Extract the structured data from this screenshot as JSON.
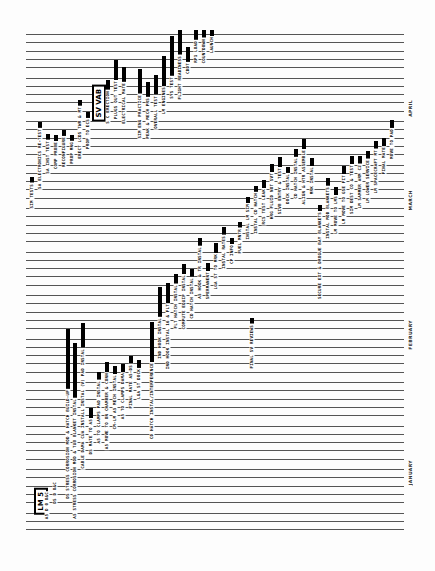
{
  "document": {
    "title": "LM-5 / SV VAB Processing Schedule (rotated Gantt chart)",
    "orientation": "rotated 90 degrees counterclockwise",
    "months": [
      {
        "label": "APRIL",
        "y": 100
      },
      {
        "label": "MARCH",
        "y": 190
      },
      {
        "label": "FEBRUARY",
        "y": 320
      },
      {
        "label": "JANUARY",
        "y": 460
      }
    ],
    "boxed_labels": [
      {
        "label": "LM 5",
        "x": 34,
        "y": 488
      },
      {
        "label": "SV VAB",
        "x": 92,
        "y": 85
      }
    ],
    "rules": {
      "count": 58,
      "top": 34,
      "spacing": 8.8
    },
    "tasks": [
      {
        "label": "A5 D 0 O&C",
        "x": 45,
        "bottom": 520,
        "bar": 0
      },
      {
        "label": "DS D O&C",
        "x": 53,
        "bottom": 505,
        "bar": 0
      },
      {
        "label": "DS STRESS CORROSION MOD & HATCH BUILD-UP",
        "x": 66,
        "bottom": 500,
        "bar": 60
      },
      {
        "label": "A5 STRESS CORROSION MOD & TUB BLANKET INSTAL",
        "x": 73,
        "bottom": 520,
        "bar": 55
      },
      {
        "label": "CABLE DAMA CUA INSTALL INSTAL (V) PAD INSTAL",
        "x": 81,
        "bottom": 470,
        "bar": 25
      },
      {
        "label": "DS MATE TO A5",
        "x": 89,
        "bottom": 455,
        "bar": 10
      },
      {
        "label": "A5 TO CLAMPS PAD INSTAL",
        "x": 97,
        "bottom": 445,
        "bar": 8
      },
      {
        "label": "A5 MOVE TO ON CHAMBER & CONN",
        "x": 105,
        "bottom": 450,
        "bar": 10
      },
      {
        "label": "CM-LM A5 MECH INSTAL",
        "x": 113,
        "bottom": 430,
        "bar": 8
      },
      {
        "label": "A5 TO CLAMPS DAMA",
        "x": 121,
        "bottom": 420,
        "bar": 8
      },
      {
        "label": "FINAL MATE A5-DS",
        "x": 129,
        "bottom": 410,
        "bar": 8
      },
      {
        "label": "LGA ST DOCK",
        "x": 137,
        "bottom": 400,
        "bar": 8
      },
      {
        "label": "CD HATCH INSTAL/INTERFERENCE",
        "x": 150,
        "bottom": 440,
        "bar": 40
      },
      {
        "label": "IND HOOK INSTAL",
        "x": 158,
        "bottom": 360,
        "bar": 30
      },
      {
        "label": "IND HOOK INSTAL 16 & FLT",
        "x": 166,
        "bottom": 370,
        "bar": 20
      },
      {
        "label": "FLT HATCH INSTAL",
        "x": 174,
        "bottom": 330,
        "bar": 10
      },
      {
        "label": "COMPUTE EQUIP INSTAL",
        "x": 182,
        "bottom": 330,
        "bar": 10
      },
      {
        "label": "CD HATCH INSTAL",
        "x": 190,
        "bottom": 320,
        "bar": 8
      },
      {
        "label": "A5 HOOK & TR INSTAL",
        "x": 198,
        "bottom": 300,
        "bar": 8
      },
      {
        "label": "SPERMANENT",
        "x": 206,
        "bottom": 300,
        "bar": 8
      },
      {
        "label": "LGA ST TO MRK",
        "x": 214,
        "bottom": 290,
        "bar": 10
      },
      {
        "label": "INSTAL RATES",
        "x": 222,
        "bottom": 270,
        "bar": 8
      },
      {
        "label": "CP INFO",
        "x": 230,
        "bottom": 265,
        "bar": 6
      },
      {
        "label": "FUEL MNTR",
        "x": 238,
        "bottom": 255,
        "bar": 6
      },
      {
        "label": "INSTAL LM SIM",
        "x": 246,
        "bottom": 240,
        "bar": 6
      },
      {
        "label": "INSTAL CD HATCH",
        "x": 254,
        "bottom": 235,
        "bar": 6
      },
      {
        "label": "RCS TEST LEAK",
        "x": 262,
        "bottom": 225,
        "bar": 8
      },
      {
        "label": "HRG FLUID NOT SVT",
        "x": 270,
        "bottom": 220,
        "bar": 8
      },
      {
        "label": "SIVB ENTRY & TEST",
        "x": 278,
        "bottom": 215,
        "bar": 10
      },
      {
        "label": "DOCK INSTAL",
        "x": 286,
        "bottom": 205,
        "bar": 6
      },
      {
        "label": "CD HATCH INSTAL",
        "x": 294,
        "bottom": 200,
        "bar": 8
      },
      {
        "label": "ALIGN & HTR ASSEMBLE",
        "x": 302,
        "bottom": 205,
        "bar": 10
      },
      {
        "label": "MRK INSTAL",
        "x": 310,
        "bottom": 195,
        "bar": 8
      },
      {
        "label": "SECURE EXT & DROGUE BAY BLANKETS",
        "x": 318,
        "bottom": 300,
        "bar": 6
      },
      {
        "label": "INSTAL MOD BLANKETS",
        "x": 326,
        "bottom": 240,
        "bar": 8
      },
      {
        "label": "LM MOVE TO LMS",
        "x": 334,
        "bottom": 235,
        "bar": 8
      },
      {
        "label": "LM MOVE TO GSE FIT",
        "x": 342,
        "bottom": 225,
        "bar": 8
      },
      {
        "label": "SIM DEST CO & TEST",
        "x": 350,
        "bottom": 215,
        "bar": 8
      },
      {
        "label": "LM SAMMER ARM C2",
        "x": 358,
        "bottom": 210,
        "bar": 8
      },
      {
        "label": "LM LOWER SERVICE",
        "x": 366,
        "bottom": 205,
        "bar": 8
      },
      {
        "label": "LM SPACECRAFT MT",
        "x": 374,
        "bottom": 195,
        "bar": 8
      },
      {
        "label": "FINAL MATE",
        "x": 382,
        "bottom": 175,
        "bar": 8
      },
      {
        "label": "MOVE TO PAD",
        "x": 390,
        "bottom": 160,
        "bar": 8
      },
      {
        "label": "SIM TESTS",
        "x": 30,
        "bottom": 210,
        "bar": 6
      },
      {
        "label": "SA ELECTRONICS RE-TEST",
        "x": 38,
        "bottom": 190,
        "bar": 6
      },
      {
        "label": "SA INST TEST",
        "x": 46,
        "bottom": 175,
        "bar": 6
      },
      {
        "label": "COMP PROBE",
        "x": 54,
        "bottom": 170,
        "bar": 6
      },
      {
        "label": "RECONFIGURE",
        "x": 62,
        "bottom": 168,
        "bar": 6
      },
      {
        "label": "PROP MNG",
        "x": 70,
        "bottom": 165,
        "bar": 6
      },
      {
        "label": "ERECT LCDS TWR & MT",
        "x": 78,
        "bottom": 160,
        "bar": 6
      },
      {
        "label": "PROP TO ECS",
        "x": 86,
        "bottom": 150,
        "bar": 6
      },
      {
        "label": "S C ERECTION",
        "x": 106,
        "bottom": 125,
        "bar": 10
      },
      {
        "label": "PLUGS OUT TEST",
        "x": 114,
        "bottom": 120,
        "bar": 20
      },
      {
        "label": "ELECTRICAL MATE",
        "x": 122,
        "bottom": 125,
        "bar": 15
      },
      {
        "label": "SIM ENG PRACTICE",
        "x": 138,
        "bottom": 140,
        "bar": 25
      },
      {
        "label": "PEAK & MECH PRS",
        "x": 146,
        "bottom": 140,
        "bar": 15
      },
      {
        "label": "OVERALL TEST",
        "x": 154,
        "bottom": 130,
        "bar": 20
      },
      {
        "label": "LM ENGINES",
        "x": 162,
        "bottom": 115,
        "bar": 30
      },
      {
        "label": "SYS TEST",
        "x": 170,
        "bottom": 100,
        "bar": 40
      },
      {
        "label": "FLIGHT READINESS",
        "x": 178,
        "bottom": 85,
        "bar": 25
      },
      {
        "label": "CDDT",
        "x": 186,
        "bottom": 75,
        "bar": 15
      },
      {
        "label": "RP1 LOAD",
        "x": 194,
        "bottom": 60,
        "bar": 10
      },
      {
        "label": "COUNTDOWN",
        "x": 202,
        "bottom": 50,
        "bar": 8
      },
      {
        "label": "LAUNCH",
        "x": 210,
        "bottom": 45,
        "bar": 6
      },
      {
        "label": "FINAL SV REVIEWS",
        "x": 250,
        "bottom": 370,
        "bar": 6
      }
    ]
  }
}
